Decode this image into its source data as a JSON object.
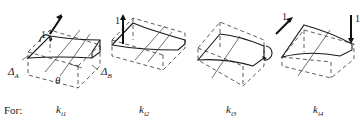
{
  "diagram": {
    "type": "beam-stiffness-cases",
    "cases": [
      {
        "id": "case1",
        "label_base": "k",
        "label_sub": "i1",
        "load": "unit rotation (moment arrow) at end A",
        "load_label": "1"
      },
      {
        "id": "case2",
        "label_base": "k",
        "label_sub": "i2",
        "load": "unit upward displacement at end A",
        "load_label": "1"
      },
      {
        "id": "case3",
        "label_base": "k",
        "label_sub": "i3",
        "load": "unit rotation at end B",
        "load_label": "1"
      },
      {
        "id": "case4",
        "label_base": "k",
        "label_sub": "i4",
        "load": "unit downward displacement at end B",
        "load_label": "1"
      }
    ],
    "annotations": {
      "delta_a": {
        "base": "Δ",
        "sub": "A"
      },
      "delta_b": {
        "base": "Δ",
        "sub": "B"
      },
      "theta": "θ"
    },
    "row_label": "For:"
  }
}
